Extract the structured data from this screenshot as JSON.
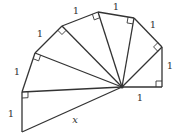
{
  "diagram": {
    "stroke_color": "#333333",
    "center": [
      122,
      87
    ],
    "outer_vertices": [
      [
        162,
        87
      ],
      [
        162,
        47
      ],
      [
        134,
        18
      ],
      [
        98,
        12
      ],
      [
        62,
        26
      ],
      [
        35,
        53
      ],
      [
        22,
        92
      ],
      [
        22,
        132
      ]
    ],
    "edge_labels": [
      {
        "text": "1",
        "x": 140,
        "y": 101
      },
      {
        "text": "1",
        "x": 170,
        "y": 69
      },
      {
        "text": "1",
        "x": 153,
        "y": 28
      },
      {
        "text": "1",
        "x": 116,
        "y": 10
      },
      {
        "text": "1",
        "x": 76,
        "y": 14
      },
      {
        "text": "1",
        "x": 40,
        "y": 37
      },
      {
        "text": "1",
        "x": 17,
        "y": 75
      },
      {
        "text": "1",
        "x": 11,
        "y": 117
      }
    ],
    "unknown_label": {
      "text": "x",
      "x": 75,
      "y": 123
    }
  }
}
